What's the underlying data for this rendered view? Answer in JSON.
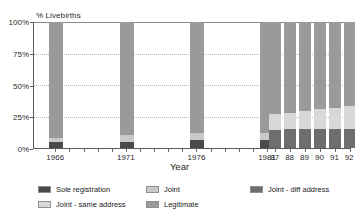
{
  "chart_data": {
    "type": "bar",
    "stacked": true,
    "title": "",
    "subtitle": "",
    "xlabel": "Year",
    "ylabel": "% Livebirths",
    "ylim": [
      0,
      100
    ],
    "ytick_labels": [
      "0%",
      "25%",
      "50%",
      "75%",
      "100%"
    ],
    "ytick_values": [
      0,
      25,
      50,
      75,
      100
    ],
    "grid": true,
    "grid_axis": "y",
    "legend_position": "bottom",
    "categories": [
      "1966",
      "1971",
      "1976",
      "1981",
      "87",
      "88",
      "89",
      "90",
      "91",
      "92"
    ],
    "series": [
      {
        "name": "Sole registration",
        "color": "#4a4a4a",
        "values": [
          5,
          5,
          6,
          6,
          null,
          null,
          null,
          null,
          null,
          null
        ]
      },
      {
        "name": "Joint",
        "color": "#c9c9c9",
        "values": [
          3,
          5,
          6,
          6,
          null,
          null,
          null,
          null,
          null,
          null
        ]
      },
      {
        "name": "Joint - diff address",
        "color": "#6e6e6e",
        "values": [
          null,
          null,
          null,
          null,
          14,
          15,
          15,
          15,
          15,
          15
        ]
      },
      {
        "name": "Joint - same address",
        "color": "#d8d8d8",
        "values": [
          null,
          null,
          null,
          null,
          13,
          13,
          14,
          16,
          17,
          18
        ]
      },
      {
        "name": "Legitimate",
        "color": "#9a9a9a",
        "values": [
          92,
          90,
          88,
          88,
          73,
          72,
          71,
          69,
          68,
          67
        ]
      }
    ],
    "bars": [
      {
        "category": "1966",
        "x_pct": 4.8,
        "width_pct": 4.4,
        "segments": [
          {
            "series": "Sole registration",
            "value": 5
          },
          {
            "series": "Joint",
            "value": 3
          },
          {
            "series": "Legitimate",
            "value": 92
          }
        ]
      },
      {
        "category": "1971",
        "x_pct": 27.0,
        "width_pct": 4.4,
        "segments": [
          {
            "series": "Sole registration",
            "value": 5
          },
          {
            "series": "Joint",
            "value": 5
          },
          {
            "series": "Legitimate",
            "value": 90
          }
        ]
      },
      {
        "category": "1976",
        "x_pct": 49.2,
        "width_pct": 4.4,
        "segments": [
          {
            "series": "Sole registration",
            "value": 6
          },
          {
            "series": "Joint",
            "value": 6
          },
          {
            "series": "Legitimate",
            "value": 88
          }
        ]
      },
      {
        "category": "1981",
        "x_pct": 71.4,
        "width_pct": 4.4,
        "segments": [
          {
            "series": "Sole registration",
            "value": 6
          },
          {
            "series": "Joint",
            "value": 6
          },
          {
            "series": "Legitimate",
            "value": 88
          }
        ]
      },
      {
        "category": "87",
        "x_pct": 74.2,
        "width_pct": 3.7,
        "segments": [
          {
            "series": "Joint - diff address",
            "value": 14
          },
          {
            "series": "Joint - same address",
            "value": 13
          },
          {
            "series": "Legitimate",
            "value": 73
          }
        ]
      },
      {
        "category": "88",
        "x_pct": 78.9,
        "width_pct": 3.7,
        "segments": [
          {
            "series": "Joint - diff address",
            "value": 15
          },
          {
            "series": "Joint - same address",
            "value": 13
          },
          {
            "series": "Legitimate",
            "value": 72
          }
        ]
      },
      {
        "category": "89",
        "x_pct": 83.6,
        "width_pct": 3.7,
        "segments": [
          {
            "series": "Joint - diff address",
            "value": 15
          },
          {
            "series": "Joint - same address",
            "value": 14
          },
          {
            "series": "Legitimate",
            "value": 71
          }
        ]
      },
      {
        "category": "90",
        "x_pct": 88.3,
        "width_pct": 3.7,
        "segments": [
          {
            "series": "Joint - diff address",
            "value": 15
          },
          {
            "series": "Joint - same address",
            "value": 16
          },
          {
            "series": "Legitimate",
            "value": 69
          }
        ]
      },
      {
        "category": "91",
        "x_pct": 93.0,
        "width_pct": 3.7,
        "segments": [
          {
            "series": "Joint - diff address",
            "value": 15
          },
          {
            "series": "Joint - same address",
            "value": 17
          },
          {
            "series": "Legitimate",
            "value": 68
          }
        ]
      },
      {
        "category": "92",
        "x_pct": 97.7,
        "width_pct": 3.7,
        "segments": [
          {
            "series": "Joint - diff address",
            "value": 15
          },
          {
            "series": "Joint - same address",
            "value": 18
          },
          {
            "series": "Legitimate",
            "value": 67
          }
        ]
      }
    ],
    "x_tick_labels": [
      {
        "label": "1966",
        "x_pct": 7.0
      },
      {
        "label": "1971",
        "x_pct": 29.2
      },
      {
        "label": "1976",
        "x_pct": 51.4
      },
      {
        "label": "1981",
        "x_pct": 73.6
      },
      {
        "label": "87",
        "x_pct": 76.0
      },
      {
        "label": "88",
        "x_pct": 80.7
      },
      {
        "label": "89",
        "x_pct": 85.4
      },
      {
        "label": "90",
        "x_pct": 90.1
      },
      {
        "label": "91",
        "x_pct": 94.8
      },
      {
        "label": "92",
        "x_pct": 99.4
      }
    ],
    "x_minor_ticks_pct": [
      7.0,
      11.4,
      15.9,
      20.3,
      24.8,
      29.2,
      33.7,
      38.1,
      42.6,
      47.0,
      51.4,
      55.9,
      60.3,
      64.8,
      69.2,
      73.6
    ]
  },
  "legend": {
    "items": [
      {
        "label": "Sole registration",
        "color": "#4a4a4a",
        "col": 0,
        "row": 0
      },
      {
        "label": "Joint",
        "color": "#c9c9c9",
        "col": 1,
        "row": 0
      },
      {
        "label": "Joint - diff address",
        "color": "#6e6e6e",
        "col": 2,
        "row": 0
      },
      {
        "label": "Joint - same address",
        "color": "#d8d8d8",
        "col": 0,
        "row": 1
      },
      {
        "label": "Legitimate",
        "color": "#9a9a9a",
        "col": 1,
        "row": 1
      }
    ]
  },
  "colors": {
    "axis": "#5a5a5a",
    "grid": "#b9b9b9",
    "text": "#222222",
    "background": "#ffffff"
  }
}
